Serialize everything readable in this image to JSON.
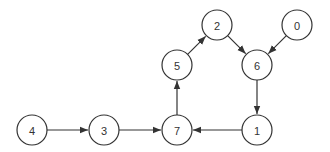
{
  "diagram": {
    "type": "directed-graph",
    "node_radius": 15,
    "colors": {
      "stroke": "#333333",
      "fill": "#ffffff",
      "background": "#ffffff"
    },
    "nodes": [
      {
        "id": "0",
        "label": "0",
        "x": 297,
        "y": 25
      },
      {
        "id": "1",
        "label": "1",
        "x": 257,
        "y": 130
      },
      {
        "id": "2",
        "label": "2",
        "x": 217,
        "y": 25
      },
      {
        "id": "3",
        "label": "3",
        "x": 104,
        "y": 130
      },
      {
        "id": "4",
        "label": "4",
        "x": 32,
        "y": 130
      },
      {
        "id": "5",
        "label": "5",
        "x": 177,
        "y": 65
      },
      {
        "id": "6",
        "label": "6",
        "x": 257,
        "y": 65
      },
      {
        "id": "7",
        "label": "7",
        "x": 177,
        "y": 130
      }
    ],
    "edges": [
      {
        "from": "4",
        "to": "3"
      },
      {
        "from": "3",
        "to": "7"
      },
      {
        "from": "1",
        "to": "7"
      },
      {
        "from": "7",
        "to": "5"
      },
      {
        "from": "5",
        "to": "2"
      },
      {
        "from": "2",
        "to": "6"
      },
      {
        "from": "0",
        "to": "6"
      },
      {
        "from": "6",
        "to": "1"
      }
    ]
  }
}
